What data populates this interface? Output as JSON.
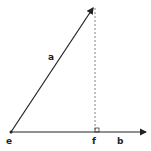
{
  "diagram": {
    "type": "vector-projection",
    "labels": {
      "vector_a": "a",
      "vector_b": "b",
      "origin": "e",
      "foot": "f"
    },
    "colors": {
      "line": "#222222",
      "dashed": "#666666",
      "background": "#ffffff"
    }
  }
}
